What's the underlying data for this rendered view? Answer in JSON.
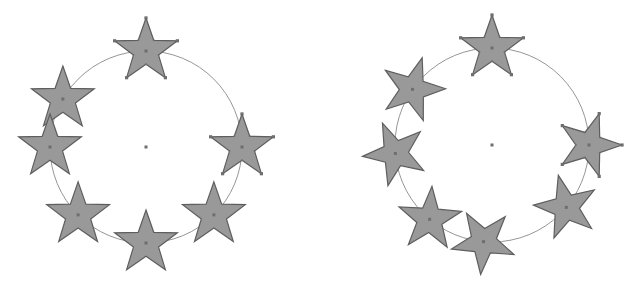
{
  "diagram": {
    "colors": {
      "star_fill": "#999999",
      "star_stroke": "#5e5e5e",
      "circle_stroke": "#8a8a8a",
      "handle": "#6e6e6e"
    },
    "panels": [
      {
        "name": "upright-stars",
        "center": [
          146,
          147
        ],
        "radius": 96,
        "star_radius": 33,
        "rotate_with_angle": false,
        "angles": [
          -90,
          -150,
          180,
          135,
          90,
          45,
          0
        ],
        "selected": [
          0,
          6
        ]
      },
      {
        "name": "rotated-stars",
        "center": [
          492,
          145
        ],
        "radius": 97,
        "star_radius": 33,
        "rotate_with_angle": true,
        "angles": [
          -90,
          -145,
          175,
          130,
          95,
          40,
          0
        ],
        "selected": [
          0,
          6
        ]
      }
    ]
  }
}
